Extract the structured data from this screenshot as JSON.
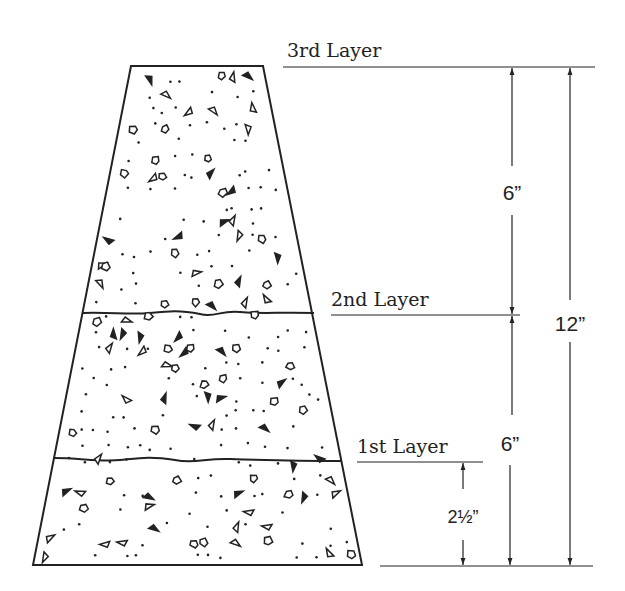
{
  "diagram": {
    "layers": [
      {
        "label": "3rd Layer",
        "y": 66
      },
      {
        "label": "2nd Layer",
        "y": 313
      },
      {
        "label": "1st Layer",
        "y": 461
      }
    ],
    "dimensions": {
      "top_to_2nd": "6”",
      "2nd_to_base": "6”",
      "total": "12”",
      "rod_penetration": "2½”"
    },
    "colors": {
      "line": "#222222",
      "background": "#ffffff"
    }
  }
}
